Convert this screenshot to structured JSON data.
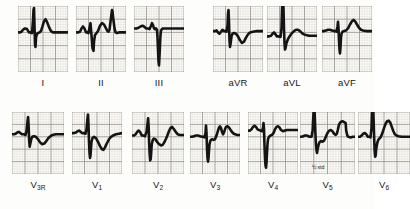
{
  "figure": {
    "kind": "12-lead-electrocardiogram",
    "background_color": "#fdfdfb",
    "grid_color_fine": "#c9c6bd",
    "grid_color_bold": "#8d8a82",
    "trace_color": "#141414",
    "label_color": "#17171a",
    "annotation": {
      "text": "½ std",
      "lead": "V5"
    }
  },
  "rows": [
    {
      "name": "limb-and-augmented-leads",
      "leads": [
        "I",
        "II",
        "III",
        "aVR",
        "aVL",
        "aVF"
      ]
    },
    {
      "name": "precordial-leads",
      "leads": [
        "V3R",
        "V1",
        "V2",
        "V3",
        "V4",
        "V5",
        "V6"
      ]
    }
  ],
  "chart_data": {
    "type": "line",
    "title": "",
    "xlabel": "",
    "ylabel": "",
    "grid": true,
    "legend_position": "none",
    "x": [
      0,
      100
    ],
    "ylim": [
      -100,
      100
    ],
    "panels": [
      {
        "label": "I",
        "label_main": "I",
        "label_sub": "",
        "x": 18,
        "y": 6,
        "w": 50,
        "h": 66,
        "grid_cols": 4,
        "grid_rows": 5,
        "baseline": 40,
        "points": "0,40 4,40 7,39 10,36 14,34 18,35 22,40 26,40 28,41 30,22 31,6 32,3 33,30 34,58 35,62 36,48 38,42 40,41 43,40 46,38 49,31 52,23 55,20 58,24 62,32 66,38 70,40 76,40 82,40 90,40 100,40"
      },
      {
        "label": "II",
        "label_main": "II",
        "label_sub": "",
        "x": 76,
        "y": 6,
        "w": 50,
        "h": 66,
        "grid_cols": 4,
        "grid_rows": 5,
        "baseline": 40,
        "points": "0,40 4,40 8,39 11,34 14,31 17,34 20,40 23,40 25,41 27,33 29,26 31,44 33,64 35,68 36,54 38,44 40,42 44,38 48,30 52,26 56,28 60,34 63,38 65,39 67,36 69,24 71,12 72,6 73,9 75,22 77,34 79,40 82,41 86,40 92,40 100,40"
      },
      {
        "label": "III",
        "label_main": "III",
        "label_sub": "",
        "x": 134,
        "y": 6,
        "w": 50,
        "h": 66,
        "grid_cols": 4,
        "grid_rows": 5,
        "baseline": 34,
        "points": "0,34 5,34 9,33 13,31 17,30 20,31 24,34 28,34 31,35 34,30 36,26 38,29 40,34 42,35 44,34 46,36 47,48 48,66 49,84 50,90 51,76 52,58 53,44 54,37 56,35 58,34 62,34 68,34 76,34 86,34 100,34"
      },
      {
        "label": "aVR",
        "label_main": "aVR",
        "label_sub": "",
        "x": 213,
        "y": 6,
        "w": 50,
        "h": 66,
        "grid_cols": 4,
        "grid_rows": 5,
        "baseline": 38,
        "points": "0,38 4,38 7,37 10,40 13,42 16,39 19,36 22,38 25,38 27,39 29,30 30,12 31,6 32,26 33,52 34,62 35,58 37,46 39,42 42,41 46,42 50,46 54,52 58,56 62,54 66,48 70,43 74,40 80,39 88,38 100,38"
      },
      {
        "label": "aVL",
        "label_main": "aVL",
        "label_sub": "",
        "x": 267,
        "y": 6,
        "w": 50,
        "h": 66,
        "grid_cols": 4,
        "grid_rows": 5,
        "baseline": 46,
        "points": "0,46 4,46 8,45 11,42 14,40 17,43 20,46 24,46 27,47 29,34 30,6 31,-12 32,-16 33,4 34,34 35,56 36,66 37,64 39,56 42,50 46,45 50,41 54,38 58,36 62,36 66,38 70,41 74,43 78,44 84,45 92,45 100,45"
      },
      {
        "label": "aVF",
        "label_main": "aVF",
        "label_sub": "",
        "x": 322,
        "y": 6,
        "w": 50,
        "h": 66,
        "grid_cols": 4,
        "grid_rows": 5,
        "baseline": 38,
        "points": "0,38 4,38 8,37 12,36 16,36 20,37 24,38 27,38 29,39 31,31 32,24 33,34 34,52 35,66 36,72 37,62 38,48 39,42 41,39 44,38 48,37 52,34 56,28 60,23 63,21 66,23 70,28 74,33 78,36 82,37 88,38 94,38 100,38"
      },
      {
        "label": "V3R",
        "label_main": "V",
        "label_sub": "3R",
        "x": 12,
        "y": 112,
        "w": 52,
        "h": 62,
        "grid_cols": 4,
        "grid_rows": 5,
        "baseline": 36,
        "points": "0,36 4,36 7,35 10,33 13,32 16,34 19,36 23,36 26,37 28,30 30,14 31,8 32,24 33,46 34,56 35,52 37,44 39,40 42,39 46,40 50,44 54,49 58,52 62,51 66,47 70,42 74,39 78,37 84,36 92,36 100,36"
      },
      {
        "label": "V1",
        "label_main": "V",
        "label_sub": "1",
        "x": 72,
        "y": 112,
        "w": 50,
        "h": 62,
        "grid_cols": 4,
        "grid_rows": 5,
        "baseline": 34,
        "points": "0,34 4,34 8,33 11,31 14,30 17,32 20,34 24,34 27,35 29,28 31,10 32,4 33,22 34,48 35,66 36,74 37,70 38,58 39,48 41,42 44,40 48,42 52,48 56,55 60,60 63,61 66,57 70,50 74,44 78,40 82,38 88,36 94,35 100,34"
      },
      {
        "label": "V2",
        "label_main": "V",
        "label_sub": "2",
        "x": 132,
        "y": 112,
        "w": 52,
        "h": 62,
        "grid_cols": 4,
        "grid_rows": 5,
        "baseline": 38,
        "points": "0,38 4,38 7,36 10,32 13,30 16,33 19,38 22,38 25,39 28,32 30,18 31,10 32,24 33,50 34,68 35,78 36,76 37,64 38,52 40,45 42,43 45,44 48,48 52,52 56,54 59,53 62,49 65,44 68,38 71,31 74,26 77,24 80,27 84,32 88,36 92,37 100,37"
      },
      {
        "label": "V3",
        "label_main": "V",
        "label_sub": "3",
        "x": 190,
        "y": 112,
        "w": 50,
        "h": 62,
        "grid_cols": 4,
        "grid_rows": 5,
        "baseline": 40,
        "points": "0,40 4,40 8,39 12,38 16,38 20,39 24,40 27,40 29,41 31,34 32,22 33,34 34,58 35,74 36,80 37,74 38,62 39,52 41,46 44,44 47,45 50,44 53,38 56,30 58,25 60,23 62,26 64,32 66,36 68,33 70,28 72,24 75,23 78,25 82,30 86,34 90,36 95,37 100,37"
      },
      {
        "label": "V4",
        "label_main": "V",
        "label_sub": "4",
        "x": 248,
        "y": 112,
        "w": 50,
        "h": 62,
        "grid_cols": 4,
        "grid_rows": 5,
        "baseline": 30,
        "points": "0,30 4,30 7,28 10,24 13,22 16,24 19,28 22,29 25,30 28,31 30,26 31,18 32,28 33,54 34,74 35,86 36,90 37,82 38,66 39,52 40,44 42,40 45,38 48,37 51,34 54,28 57,24 60,23 63,25 66,29 70,31 74,30 78,29 84,29 92,29 100,29"
      },
      {
        "label": "V5",
        "label_main": "V",
        "label_sub": "5",
        "x": 300,
        "y": 112,
        "w": 55,
        "h": 62,
        "grid_cols": 4,
        "grid_rows": 5,
        "baseline": 40,
        "note": "½ std",
        "points": "0,40 3,40 6,39 9,38 12,38 15,39 18,40 21,40 23,30 24,10 25,-6 26,-10 27,10 28,34 29,52 30,62 31,66 32,60 34,52 36,48 38,47 41,48 44,46 47,40 50,34 53,30 56,29 59,31 62,35 65,37 67,35 69,28 71,20 74,16 77,15 80,16 83,18 84,30 86,38 88,40 92,41 96,40 100,40"
      },
      {
        "label": "V6",
        "label_main": "V",
        "label_sub": "6",
        "x": 358,
        "y": 112,
        "w": 52,
        "h": 62,
        "grid_cols": 4,
        "grid_rows": 5,
        "baseline": 40,
        "points": "0,40 4,40 7,38 10,35 13,34 16,36 19,40 22,40 24,41 26,26 27,2 28,-10 29,-12 30,12 31,40 32,62 33,72 34,70 35,60 37,50 39,45 41,43 44,40 47,34 50,26 53,19 56,15 59,14 62,17 65,24 68,31 71,36 74,38 78,39 84,40 92,40 100,40"
      }
    ]
  }
}
